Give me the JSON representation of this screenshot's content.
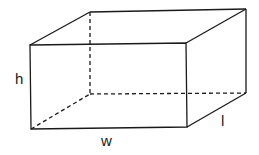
{
  "diagram": {
    "shape": "cuboid",
    "labels": {
      "height": "h",
      "width": "w",
      "length": "l"
    },
    "colors": {
      "line": "#1a1a1a",
      "background": "#ffffff"
    },
    "vertices": {
      "front_top_left": [
        30,
        45
      ],
      "front_top_right": [
        186,
        43
      ],
      "front_bottom_left": [
        31,
        129
      ],
      "front_bottom_right": [
        187,
        127
      ],
      "back_top_left": [
        90,
        12
      ],
      "back_top_right": [
        246,
        9
      ],
      "back_bottom_right": [
        246,
        93
      ],
      "back_bottom_left": [
        90,
        94
      ]
    },
    "hidden_edges": [
      "back_top_left-back_bottom_left",
      "back_bottom_left-back_bottom_right",
      "back_bottom_left-front_bottom_left"
    ]
  }
}
